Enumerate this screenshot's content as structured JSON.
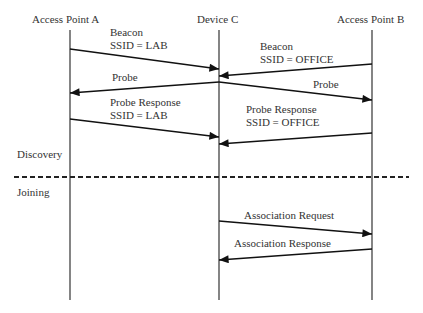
{
  "diagram": {
    "type": "sequence",
    "participants": [
      {
        "id": "A",
        "label": "Access Point A",
        "x": 70
      },
      {
        "id": "C",
        "label": "Device C",
        "x": 219
      },
      {
        "id": "B",
        "label": "Access Point B",
        "x": 372
      }
    ],
    "phases": [
      {
        "label": "Discovery"
      },
      {
        "label": "Joining"
      }
    ],
    "messages": [
      {
        "from": "A",
        "to": "C",
        "line1": "Beacon",
        "line2": "SSID = LAB"
      },
      {
        "from": "B",
        "to": "C",
        "line1": "Beacon",
        "line2": "SSID = OFFICE"
      },
      {
        "from": "C",
        "to": "A",
        "line1": "Probe"
      },
      {
        "from": "C",
        "to": "B",
        "line1": "Probe"
      },
      {
        "from": "A",
        "to": "C",
        "line1": "Probe Response",
        "line2": "SSID = LAB"
      },
      {
        "from": "B",
        "to": "C",
        "line1": "Probe Response",
        "line2": "SSID = OFFICE"
      },
      {
        "from": "C",
        "to": "B",
        "line1": "Association Request"
      },
      {
        "from": "B",
        "to": "C",
        "line1": "Association Response"
      }
    ]
  }
}
